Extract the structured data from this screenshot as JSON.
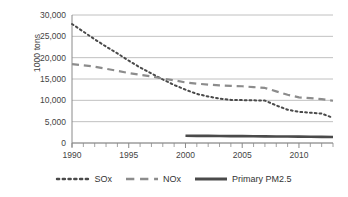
{
  "chart_data": {
    "type": "line",
    "title": "",
    "xlabel": "",
    "ylabel": "1000 tons",
    "xlim": [
      1990,
      2013
    ],
    "ylim": [
      0,
      30000
    ],
    "grid": true,
    "legend_position": "bottom",
    "y_ticks": [
      "30,000",
      "25,000",
      "20,000",
      "15,000",
      "10,000",
      "5,000",
      "0"
    ],
    "y_tick_values": [
      30000,
      25000,
      20000,
      15000,
      10000,
      5000,
      0
    ],
    "x_ticks": [
      "1990",
      "1995",
      "2000",
      "2005",
      "2010"
    ],
    "x_tick_values": [
      1990,
      1995,
      2000,
      2005,
      2010
    ],
    "x": [
      1990,
      1991,
      1992,
      1993,
      1994,
      1995,
      1996,
      1997,
      1998,
      1999,
      2000,
      2001,
      2002,
      2003,
      2004,
      2005,
      2006,
      2007,
      2008,
      2009,
      2010,
      2011,
      2012,
      2013
    ],
    "series": [
      {
        "name": "SOx",
        "style": "dotted",
        "color": "#4a4a4a",
        "values": [
          27900,
          26100,
          24300,
          22600,
          21000,
          19300,
          17700,
          16300,
          14900,
          13600,
          12500,
          11500,
          10900,
          10400,
          10100,
          10050,
          10000,
          9950,
          8800,
          7800,
          7300,
          7100,
          6900,
          5900
        ]
      },
      {
        "name": "NOx",
        "style": "dashed",
        "color": "#8c8c8c",
        "values": [
          18500,
          18200,
          17900,
          17400,
          16900,
          16400,
          16000,
          15600,
          15100,
          14700,
          14200,
          13900,
          13700,
          13500,
          13400,
          13300,
          13100,
          12900,
          12100,
          11300,
          10700,
          10500,
          10300,
          9900
        ]
      },
      {
        "name": "Primary PM2.5",
        "style": "solid",
        "color": "#4a4a4a",
        "x_start": 2000,
        "values": [
          null,
          null,
          null,
          null,
          null,
          null,
          null,
          null,
          null,
          null,
          1700,
          1680,
          1660,
          1640,
          1620,
          1600,
          1580,
          1560,
          1540,
          1520,
          1490,
          1460,
          1440,
          1420
        ]
      }
    ]
  },
  "legend": {
    "items": [
      {
        "label": "SOx",
        "style": "dotted"
      },
      {
        "label": "NOx",
        "style": "dashed"
      },
      {
        "label": "Primary PM2.5",
        "style": "solid"
      }
    ]
  }
}
